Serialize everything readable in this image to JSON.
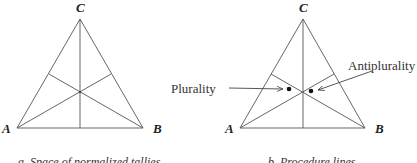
{
  "panel_a": {
    "vertices": {
      "A": "A",
      "B": "B",
      "C": "C"
    },
    "caption": "a. Space of normalized tallies"
  },
  "panel_b": {
    "vertices": {
      "A": "A",
      "B": "B",
      "C": "C"
    },
    "labels": {
      "plurality": "Plurality",
      "antiplurality": "Antiplurality"
    },
    "caption": "b. Procedure lines"
  },
  "colors": {
    "line": "#555555",
    "dot": "#111111",
    "text": "#222222"
  }
}
